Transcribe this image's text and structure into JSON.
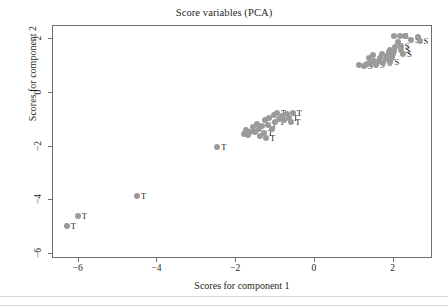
{
  "chart_data": {
    "type": "scatter",
    "title": "Score variables (PCA)",
    "xlabel": "Scores for component 1",
    "ylabel": "Scores for component 2",
    "xlim": [
      -6.65,
      3.0
    ],
    "ylim": [
      -6.2,
      2.5
    ],
    "xticks": [
      -6,
      -4,
      -2,
      0,
      2
    ],
    "xtick_labels": [
      "−6",
      "−4",
      "−2",
      "0",
      "2"
    ],
    "yticks": [
      2,
      0,
      -2,
      -4,
      -6
    ],
    "ytick_labels": [
      "2",
      "0",
      "−2",
      "−4",
      "−6"
    ],
    "grid": false,
    "legend": "none",
    "marker_color": "#9a9a9a",
    "label_color": "#231f20",
    "series": [
      {
        "name": "S",
        "label": "S",
        "points": [
          {
            "x": 1.12,
            "y": 1.03,
            "label": "S"
          },
          {
            "x": 1.25,
            "y": 1.02,
            "label": "S"
          },
          {
            "x": 1.33,
            "y": 1.08,
            "label": ""
          },
          {
            "x": 1.42,
            "y": 1.12,
            "label": "S"
          },
          {
            "x": 1.38,
            "y": 1.3,
            "label": ""
          },
          {
            "x": 1.5,
            "y": 1.2,
            "label": ""
          },
          {
            "x": 1.48,
            "y": 1.4,
            "label": ""
          },
          {
            "x": 1.55,
            "y": 1.05,
            "label": "S"
          },
          {
            "x": 1.62,
            "y": 1.18,
            "label": ""
          },
          {
            "x": 1.66,
            "y": 1.32,
            "label": ""
          },
          {
            "x": 1.7,
            "y": 1.45,
            "label": ""
          },
          {
            "x": 1.74,
            "y": 1.1,
            "label": "S"
          },
          {
            "x": 1.8,
            "y": 1.25,
            "label": ""
          },
          {
            "x": 1.84,
            "y": 1.38,
            "label": ""
          },
          {
            "x": 1.88,
            "y": 1.52,
            "label": ""
          },
          {
            "x": 1.9,
            "y": 1.62,
            "label": ""
          },
          {
            "x": 1.92,
            "y": 1.16,
            "label": "S"
          },
          {
            "x": 1.96,
            "y": 1.3,
            "label": ""
          },
          {
            "x": 1.98,
            "y": 1.44,
            "label": ""
          },
          {
            "x": 2.02,
            "y": 1.58,
            "label": ""
          },
          {
            "x": 2.04,
            "y": 1.7,
            "label": ""
          },
          {
            "x": 2.0,
            "y": 2.12,
            "label": ""
          },
          {
            "x": 2.16,
            "y": 2.12,
            "label": "S"
          },
          {
            "x": 2.12,
            "y": 1.92,
            "label": ""
          },
          {
            "x": 2.18,
            "y": 1.76,
            "label": "S"
          },
          {
            "x": 2.2,
            "y": 1.6,
            "label": "S"
          },
          {
            "x": 2.24,
            "y": 1.46,
            "label": "S"
          },
          {
            "x": 2.3,
            "y": 2.12,
            "label": ""
          },
          {
            "x": 2.44,
            "y": 1.96,
            "label": "S"
          },
          {
            "x": 2.62,
            "y": 2.1,
            "label": ""
          },
          {
            "x": 2.66,
            "y": 1.94,
            "label": "S"
          }
        ]
      },
      {
        "name": "T",
        "label": "T",
        "points": [
          {
            "x": -6.3,
            "y": -4.98,
            "label": "T"
          },
          {
            "x": -6.02,
            "y": -4.58,
            "label": "T"
          },
          {
            "x": -4.52,
            "y": -3.84,
            "label": "T"
          },
          {
            "x": -2.48,
            "y": -2.0,
            "label": "T"
          },
          {
            "x": -1.8,
            "y": -1.52,
            "label": ""
          },
          {
            "x": -1.74,
            "y": -1.4,
            "label": ""
          },
          {
            "x": -1.7,
            "y": -1.58,
            "label": ""
          },
          {
            "x": -1.64,
            "y": -1.46,
            "label": ""
          },
          {
            "x": -1.58,
            "y": -1.28,
            "label": ""
          },
          {
            "x": -1.52,
            "y": -1.44,
            "label": ""
          },
          {
            "x": -1.46,
            "y": -1.16,
            "label": ""
          },
          {
            "x": -1.42,
            "y": -1.34,
            "label": ""
          },
          {
            "x": -1.4,
            "y": -1.62,
            "label": ""
          },
          {
            "x": -1.34,
            "y": -1.24,
            "label": ""
          },
          {
            "x": -1.3,
            "y": -1.48,
            "label": "T"
          },
          {
            "x": -1.26,
            "y": -1.02,
            "label": ""
          },
          {
            "x": -1.24,
            "y": -1.7,
            "label": "T"
          },
          {
            "x": -1.2,
            "y": -1.2,
            "label": "T"
          },
          {
            "x": -1.16,
            "y": -0.92,
            "label": ""
          },
          {
            "x": -1.1,
            "y": -1.36,
            "label": ""
          },
          {
            "x": -1.04,
            "y": -0.84,
            "label": ""
          },
          {
            "x": -1.0,
            "y": -1.1,
            "label": "T"
          },
          {
            "x": -0.96,
            "y": -0.74,
            "label": "T"
          },
          {
            "x": -0.9,
            "y": -0.96,
            "label": ""
          },
          {
            "x": -0.84,
            "y": -0.86,
            "label": "T"
          },
          {
            "x": -0.78,
            "y": -1.0,
            "label": ""
          },
          {
            "x": -0.72,
            "y": -0.8,
            "label": ""
          },
          {
            "x": -0.66,
            "y": -0.94,
            "label": "T"
          },
          {
            "x": -0.6,
            "y": -1.08,
            "label": "T"
          },
          {
            "x": -0.56,
            "y": -0.76,
            "label": "T"
          }
        ]
      }
    ]
  },
  "footer": {
    "rules": 2
  }
}
